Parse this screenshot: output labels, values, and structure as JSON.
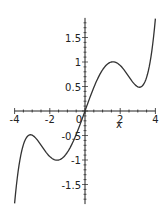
{
  "chart_data": {
    "type": "line",
    "title": "",
    "xlabel": "x",
    "ylabel": "",
    "xlim": [
      -4,
      4
    ],
    "ylim": [
      -1.9,
      1.9
    ],
    "grid": false,
    "legend": null,
    "x_ticks": [
      -4,
      -2,
      0,
      2,
      4
    ],
    "x_tick_labels": [
      "-4",
      "-2",
      "0",
      "2",
      "4"
    ],
    "y_ticks": [
      -1.5,
      -1,
      -0.5,
      0.5,
      1,
      1.5
    ],
    "y_tick_labels": [
      "-1.5",
      "-1",
      "-0.5",
      "0.5",
      "1",
      "1.5"
    ],
    "series": [
      {
        "name": "f(x)",
        "color": "#333333",
        "x": [
          -4,
          -3.6,
          -3.3,
          -3.1,
          -2.8,
          -2.4,
          -2.0,
          -1.6,
          -1.2,
          -0.8,
          -0.4,
          0,
          0.4,
          0.8,
          1.2,
          1.6,
          2.0,
          2.4,
          2.8,
          3.1,
          3.3,
          3.6,
          4
        ],
        "y": [
          -1.88,
          -0.78,
          -0.57,
          -0.49,
          -0.56,
          -0.69,
          -0.93,
          -1.0,
          -0.93,
          -0.72,
          -0.39,
          0,
          0.39,
          0.72,
          0.93,
          1.0,
          0.93,
          0.69,
          0.56,
          0.49,
          0.57,
          0.78,
          1.88
        ]
      }
    ]
  },
  "axes": {
    "x_label": "x",
    "origin_label": "0"
  }
}
